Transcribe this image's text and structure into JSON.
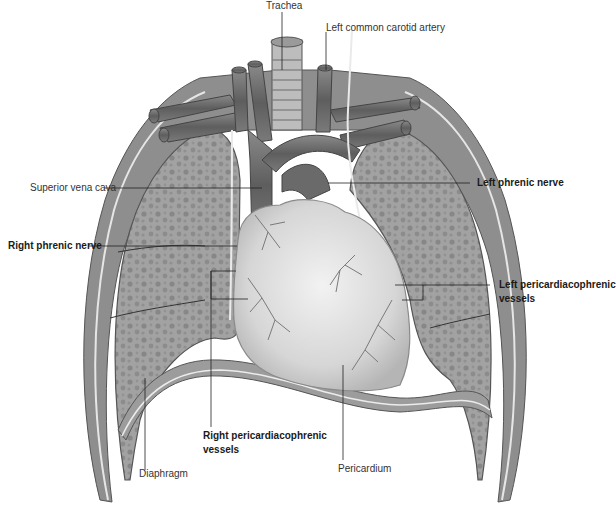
{
  "figure": {
    "labels": {
      "trachea": "Trachea",
      "left_common_carotid_artery": "Left common carotid artery",
      "superior_vena_cava": "Superior vena cava",
      "left_phrenic_nerve": "Left phrenic nerve",
      "right_phrenic_nerve": "Right phrenic nerve",
      "left_pericardiacophrenic_vessels_line1": "Left pericardiacophrenic",
      "left_pericardiacophrenic_vessels_line2": "vessels",
      "right_pericardiacophrenic_vessels_line1": "Right pericardiacophrenic",
      "right_pericardiacophrenic_vessels_line2": "vessels",
      "diaphragm": "Diaphragm",
      "pericardium": "Pericardium"
    },
    "bold_labels": [
      "left_phrenic_nerve",
      "right_phrenic_nerve",
      "left_pericardiacophrenic_vessels",
      "right_pericardiacophrenic_vessels"
    ],
    "colors": {
      "background": "#ffffff",
      "pleura_outer": "#8a8a8a",
      "lung_fill": "#9a9a9a",
      "lung_texture": "#7d7d7d",
      "vessel": "#6e6e6e",
      "heart_fill": "#dcdcdc",
      "heart_vessels": "#7a7a7a",
      "leader_line": "#222222",
      "label_text": "#333333"
    }
  }
}
